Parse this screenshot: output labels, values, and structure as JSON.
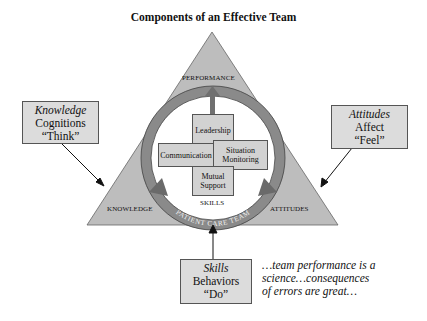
{
  "title": "Components of an Effective Team",
  "triangle": {
    "top_label": "PERFORMANCE",
    "left_label": "KNOWLEDGE",
    "right_label": "ATTITUDES",
    "bottom_label": "SKILLS",
    "ring_label": "PATIENT CARE TEAM",
    "fill_color": "#bdbdbd"
  },
  "center_components": {
    "top": "Leadership",
    "left": "Communication",
    "right_line1": "Situation",
    "right_line2": "Monitoring",
    "bottom_line1": "Mutual",
    "bottom_line2": "Support"
  },
  "callouts": {
    "knowledge": {
      "heading": "Knowledge",
      "line2": "Cognitions",
      "line3": "“Think”"
    },
    "attitudes": {
      "heading": "Attitudes",
      "line2": "Affect",
      "line3": "“Feel”"
    },
    "skills": {
      "heading": "Skills",
      "line2": "Behaviors",
      "line3": "“Do”"
    }
  },
  "quote": {
    "line1": "…team performance is a",
    "line2": "science…consequences",
    "line3": "of errors are great…"
  }
}
